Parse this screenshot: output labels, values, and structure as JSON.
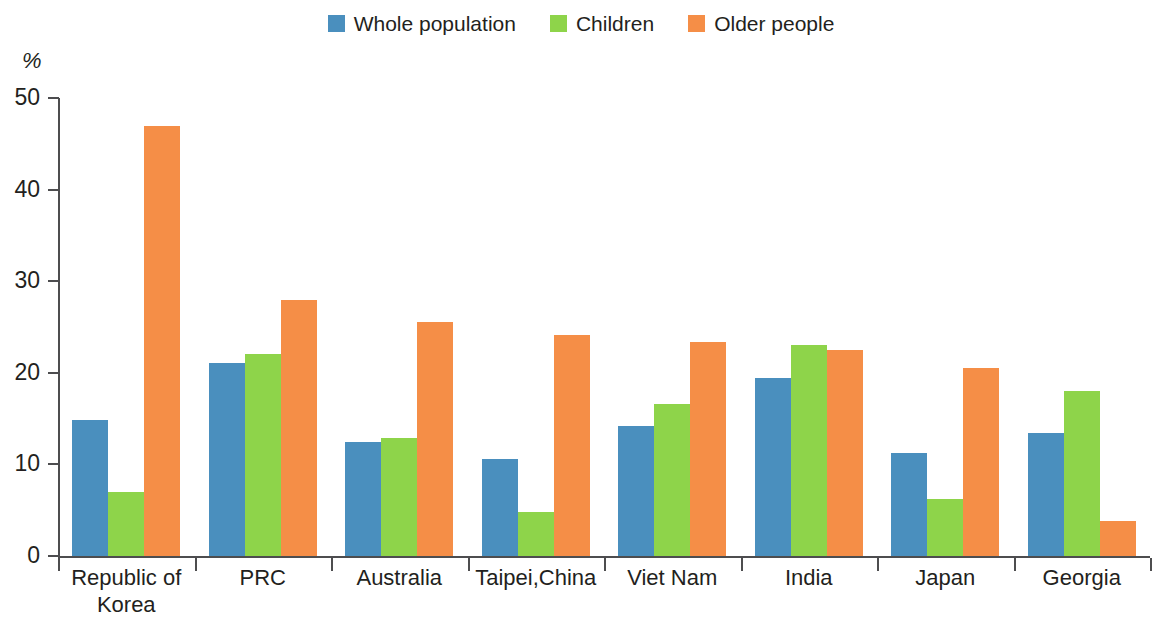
{
  "chart_data": {
    "type": "bar",
    "title": "",
    "subtitle": "",
    "xlabel": "",
    "ylabel": "%",
    "ylim": [
      0,
      50
    ],
    "ytick_labels": [
      "50",
      "40",
      "30",
      "20",
      "10",
      "0"
    ],
    "ytick_values": [
      50,
      40,
      30,
      20,
      10,
      0
    ],
    "grid": false,
    "legend_position": "top-center",
    "categories": [
      "Republic of Korea",
      "PRC",
      "Australia",
      "Taipei,China",
      "Viet Nam",
      "India",
      "Japan",
      "Georgia"
    ],
    "category_lines": [
      [
        "Republic of",
        "Korea"
      ],
      [
        "PRC"
      ],
      [
        "Australia"
      ],
      [
        "Taipei,China"
      ],
      [
        "Viet Nam"
      ],
      [
        "India"
      ],
      [
        "Japan"
      ],
      [
        "Georgia"
      ]
    ],
    "series": [
      {
        "name": "Whole population",
        "color": "#4a8fbe",
        "values": [
          14.8,
          21.1,
          12.4,
          10.6,
          14.2,
          19.4,
          11.2,
          13.4
        ]
      },
      {
        "name": "Children",
        "color": "#8ed44a",
        "values": [
          7.0,
          22.0,
          12.9,
          4.8,
          16.6,
          23.0,
          6.2,
          18.0
        ]
      },
      {
        "name": "Older people",
        "color": "#f58e47",
        "values": [
          46.9,
          28.0,
          25.5,
          24.1,
          23.4,
          22.5,
          20.5,
          3.8
        ]
      }
    ]
  },
  "legend": {
    "items": [
      {
        "label": "Whole population",
        "color": "#4a8fbe"
      },
      {
        "label": "Children",
        "color": "#8ed44a"
      },
      {
        "label": "Older people",
        "color": "#f58e47"
      }
    ]
  },
  "axis": {
    "y_unit": "%"
  }
}
